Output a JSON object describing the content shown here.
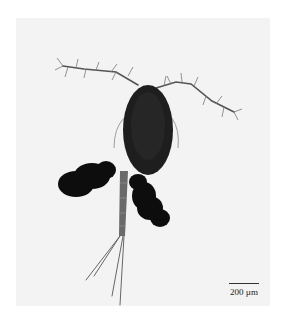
{
  "figure": {
    "scale_bar": {
      "label": "200 µm"
    },
    "colors": {
      "background": "#f3f3f3",
      "body": "#1e1e1e",
      "egg_sacs": "#0d0d0d",
      "appendages": "#555555"
    }
  }
}
